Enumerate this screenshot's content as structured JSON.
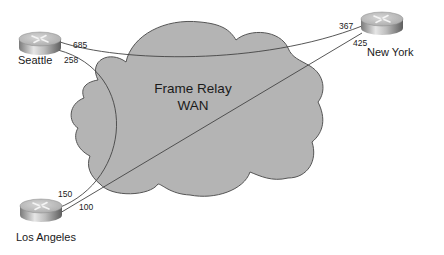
{
  "cloud": {
    "line1": "Frame Relay",
    "line2": "WAN",
    "fill": "#b4b4b4",
    "stroke": "#555555"
  },
  "routers": [
    {
      "id": "seattle",
      "label": "Seattle"
    },
    {
      "id": "new-york",
      "label": "New York"
    },
    {
      "id": "los-angeles",
      "label": "Los Angeles"
    }
  ],
  "links": [
    {
      "from": "Seattle",
      "to": "New York",
      "from_dlci": "685",
      "to_dlci": "367"
    },
    {
      "from": "Seattle",
      "to": "Los Angeles",
      "from_dlci": "258",
      "to_dlci": "150"
    },
    {
      "from": "New York",
      "to": "Los Angeles",
      "from_dlci": "425",
      "to_dlci": "100"
    }
  ],
  "colors": {
    "line": "#444444",
    "router_top": "#c8c8c8",
    "router_side_light": "#e8e8e8",
    "router_side_dark": "#6a6a6a"
  }
}
